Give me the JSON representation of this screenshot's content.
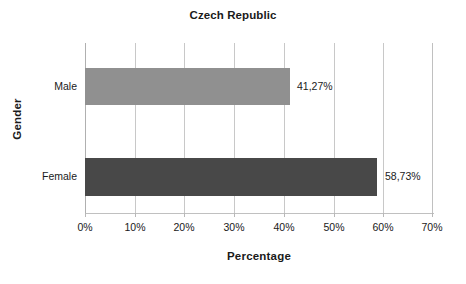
{
  "chart_data": {
    "type": "bar",
    "orientation": "horizontal",
    "title": "Czech Republic",
    "xlabel": "Percentage",
    "ylabel": "Gender",
    "categories": [
      "Male",
      "Female"
    ],
    "values": [
      41.27,
      58.73
    ],
    "data_labels": [
      "41,27%",
      "58,73%"
    ],
    "xlim": [
      0,
      70
    ],
    "xticks": [
      0,
      10,
      20,
      30,
      40,
      50,
      60,
      70
    ],
    "xtick_labels": [
      "0%",
      "10%",
      "20%",
      "30%",
      "40%",
      "50%",
      "60%",
      "70%"
    ],
    "grid": true,
    "grid_axis": "x",
    "legend": false,
    "series": [
      {
        "name": "Percentage",
        "points": [
          {
            "category": "Male",
            "value": 41.27,
            "label": "41,27%",
            "color": "#909090"
          },
          {
            "category": "Female",
            "value": 58.73,
            "label": "58,73%",
            "color": "#484848"
          }
        ]
      }
    ],
    "colors": {
      "bar_male": "#909090",
      "bar_female": "#484848",
      "gridline": "#c8c8c8",
      "axis": "#b0b0b0",
      "text": "#1a1a1a",
      "background": "#ffffff"
    }
  }
}
